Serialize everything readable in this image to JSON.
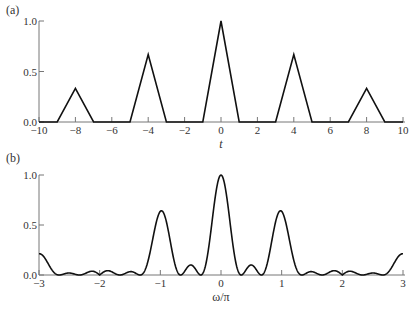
{
  "chart_data": [
    {
      "panel_label": "(a)",
      "type": "line",
      "title": "",
      "xlabel": "t",
      "ylabel": "",
      "xlim": [
        -10,
        10
      ],
      "ylim": [
        0,
        1.0
      ],
      "xticks": [
        -10,
        -8,
        -6,
        -4,
        -2,
        0,
        2,
        4,
        6,
        8,
        10
      ],
      "xtick_labels": [
        "−10",
        "−8",
        "−6",
        "−4",
        "−2",
        "0",
        "2",
        "4",
        "6",
        "8",
        "10"
      ],
      "yticks": [
        0.0,
        0.5,
        1.0
      ],
      "ytick_labels": [
        "0.0",
        "0.5",
        "1.0"
      ],
      "grid": false,
      "series": [
        {
          "name": "triangles",
          "x": [
            -10,
            -9,
            -8,
            -7,
            -5,
            -4,
            -3,
            -1,
            0,
            1,
            3,
            4,
            5,
            7,
            8,
            9,
            10
          ],
          "y": [
            0,
            0,
            0.333,
            0,
            0,
            0.667,
            0,
            0,
            1.0,
            0,
            0,
            0.667,
            0,
            0,
            0.333,
            0,
            0
          ]
        }
      ]
    },
    {
      "panel_label": "(b)",
      "type": "line",
      "title": "",
      "xlabel": "ω/π",
      "ylabel": "",
      "xlim": [
        -3,
        3
      ],
      "ylim": [
        0,
        1.0
      ],
      "xticks": [
        -3,
        -2,
        -1,
        0,
        1,
        2,
        3
      ],
      "xtick_labels": [
        "−3",
        "−2",
        "−1",
        "0",
        "1",
        "2",
        "3"
      ],
      "yticks": [
        0.0,
        0.5,
        1.0
      ],
      "ytick_labels": [
        "0.0",
        "0.5",
        "1.0"
      ],
      "grid": false,
      "series": [
        {
          "name": "magnitude spectrum",
          "x": [
            -3,
            -2.5,
            -1.5,
            -1,
            -0.5,
            0,
            0.5,
            1,
            1.5,
            2.5,
            3
          ],
          "y": [
            0.21,
            0.18,
            0.3,
            0.64,
            0.91,
            1.0,
            0.91,
            0.64,
            0.3,
            0.18,
            0.21
          ],
          "secondary_peaks": {
            "x": [
              -1.25,
              -0.75,
              -0.25,
              0.25,
              0.75,
              1.25
            ],
            "y": [
              0.15,
              0.25,
              0.31,
              0.31,
              0.25,
              0.15
            ]
          }
        }
      ]
    }
  ]
}
